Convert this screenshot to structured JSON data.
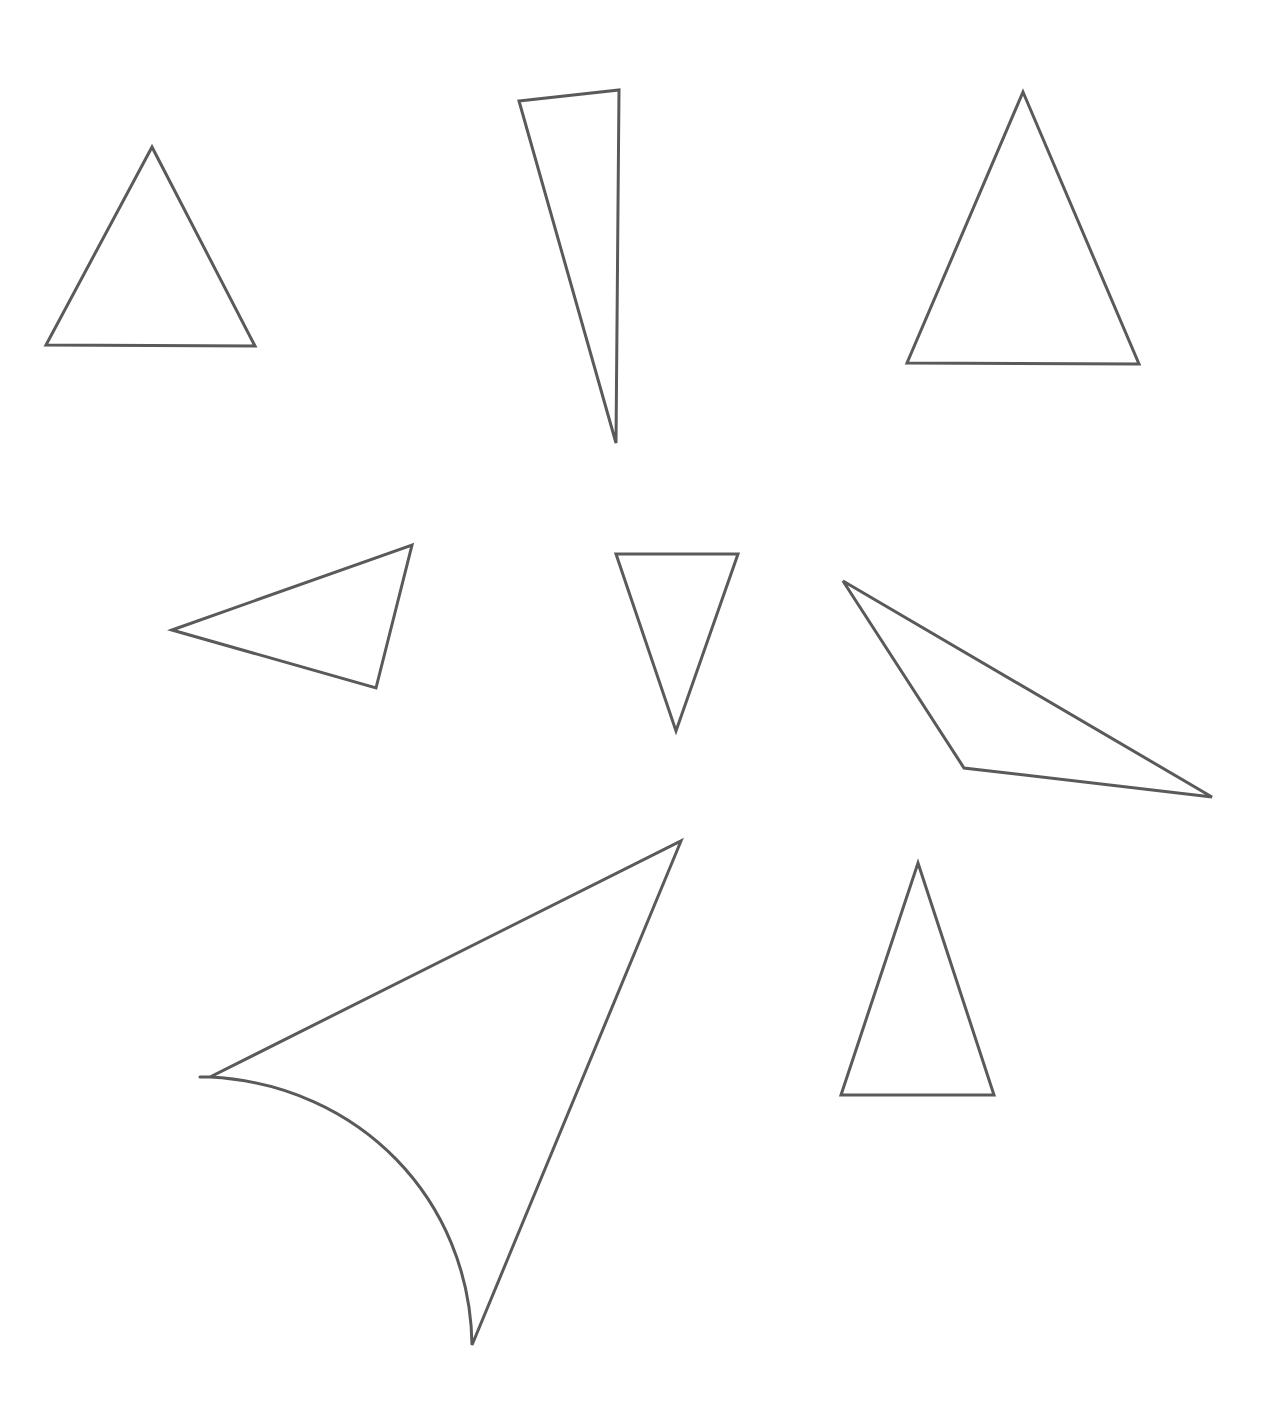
{
  "figure": {
    "width": 1272,
    "height": 1411,
    "background": "#ffffff",
    "stroke_color": "#5a5a5a",
    "stroke_width": 3
  },
  "shapes": [
    {
      "id": "triangle-1",
      "kind": "equilateral-triangle",
      "d": "M152,147 L255,346 L46,345 Z"
    },
    {
      "id": "triangle-2",
      "kind": "thin-right-triangle",
      "d": "M519,101 L619,90 L616,443 Z"
    },
    {
      "id": "triangle-3",
      "kind": "isosceles-triangle",
      "d": "M1023,92 L1139,364 L907,363 Z"
    },
    {
      "id": "triangle-4",
      "kind": "scalene-triangle-left-pointing",
      "d": "M172,630 L412,545 L376,688 Z"
    },
    {
      "id": "triangle-5",
      "kind": "inverted-isosceles-triangle",
      "d": "M616,554 L738,554 L676,731 Z"
    },
    {
      "id": "triangle-6",
      "kind": "obtuse-triangle",
      "d": "M843,581 L1212,797 L964,768 Z"
    },
    {
      "id": "triangle-7",
      "kind": "curved-side-triangle",
      "d": "M200,1077 L210,1077 L681,841 L472,1345 C470,1200 360,1085 210,1077"
    },
    {
      "id": "triangle-8",
      "kind": "tall-isosceles-triangle",
      "d": "M918,863 L994,1095 L841,1095 Z"
    }
  ]
}
